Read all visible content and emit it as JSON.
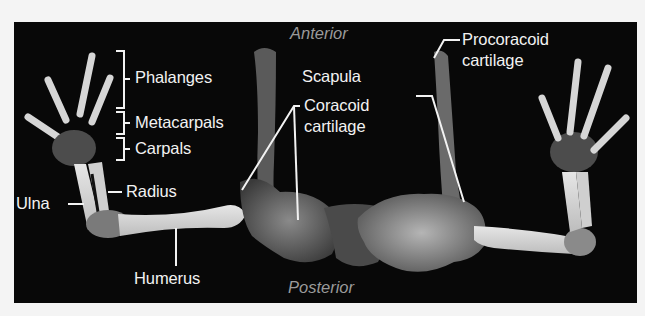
{
  "figure": {
    "orientation": {
      "top": "Anterior",
      "bottom": "Posterior"
    },
    "labels": {
      "phalanges": "Phalanges",
      "metacarpals": "Metacarpals",
      "carpals": "Carpals",
      "ulna": "Ulna",
      "radius": "Radius",
      "humerus": "Humerus",
      "coracoid_line1": "Coracoid",
      "coracoid_line2": "cartilage",
      "scapula": "Scapula",
      "procoracoid_line1": "Procoracoid",
      "procoracoid_line2": "cartilage"
    },
    "colors": {
      "background": "#080808",
      "label_text": "#f2f2f2",
      "orientation_text": "#9a9a9a",
      "bone": "#d8d8d8"
    }
  }
}
